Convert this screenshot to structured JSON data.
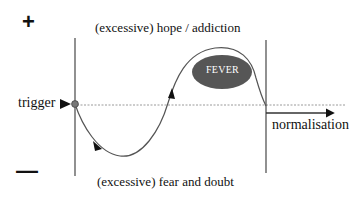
{
  "diagram": {
    "polarity": {
      "positive_symbol": "+",
      "negative_symbol": "—"
    },
    "labels": {
      "top": "(excessive) hope / addiction",
      "bottom": "(excessive) fear and doubt",
      "start": "trigger",
      "end": "normalisation",
      "peak_ellipse": "FEVER"
    },
    "colors": {
      "line": "#555555",
      "baseline_dashed": "#9a9a9a",
      "ellipse_fill": "#565656",
      "ellipse_text": "#ffffff",
      "trigger_dot": "#777777",
      "text": "#111111"
    },
    "elements": [
      {
        "id": "axis-start",
        "type": "vertical-line",
        "desc": "left boundary line at trigger point"
      },
      {
        "id": "axis-end",
        "type": "vertical-line",
        "desc": "right boundary line at normalisation point"
      },
      {
        "id": "baseline",
        "type": "dashed-line",
        "desc": "neutral baseline"
      },
      {
        "id": "curve",
        "type": "sine-like curve",
        "desc": "dips into fear and doubt, rises into hope / addiction (FEVER), returns to baseline"
      },
      {
        "id": "fever",
        "type": "ellipse",
        "desc": "dark filled ellipse at peak labeled FEVER"
      },
      {
        "id": "normalisation-arrow",
        "type": "arrow",
        "desc": "arrow pointing right along baseline after end line"
      }
    ]
  }
}
